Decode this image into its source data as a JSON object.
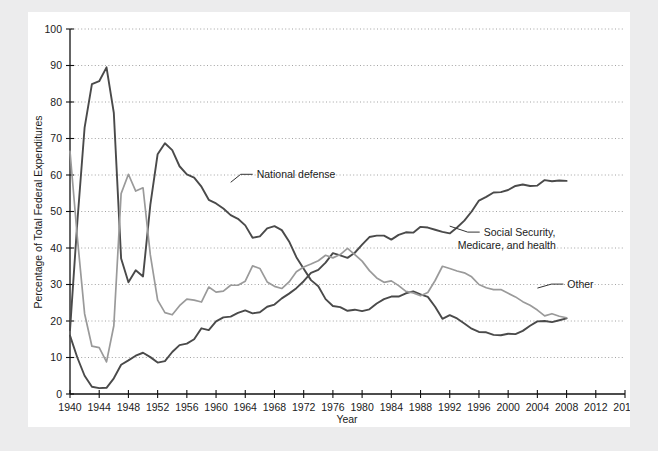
{
  "page": {
    "background_color": "#ececed",
    "panel_color": "#ffffff",
    "clipped_header_text": ""
  },
  "chart_data": {
    "type": "line",
    "title": "",
    "xlabel": "Year",
    "ylabel": "Percentage of Total Federal Expenditures",
    "xlim": [
      1940,
      2016
    ],
    "ylim": [
      0,
      100
    ],
    "xticks": [
      1940,
      1944,
      1948,
      1952,
      1956,
      1960,
      1964,
      1968,
      1972,
      1976,
      1980,
      1984,
      1988,
      1992,
      1996,
      2000,
      2004,
      2008,
      2012,
      2016
    ],
    "yticks": [
      0,
      10,
      20,
      30,
      40,
      50,
      60,
      70,
      80,
      90,
      100
    ],
    "grid": "horizontal-dotted",
    "legend_position": "inline-annotations",
    "colors": {
      "national_defense": "#4a4a4a",
      "social_security": "#4a4a4a",
      "other": "#9a9a9a",
      "axis": "#111111",
      "grid": "#8c8c8c"
    },
    "x": [
      1940,
      1941,
      1942,
      1943,
      1944,
      1945,
      1946,
      1947,
      1948,
      1949,
      1950,
      1951,
      1952,
      1953,
      1954,
      1955,
      1956,
      1957,
      1958,
      1959,
      1960,
      1961,
      1962,
      1963,
      1964,
      1965,
      1966,
      1967,
      1968,
      1969,
      1970,
      1971,
      1972,
      1973,
      1974,
      1975,
      1976,
      1977,
      1978,
      1979,
      1980,
      1981,
      1982,
      1983,
      1984,
      1985,
      1986,
      1987,
      1988,
      1989,
      1990,
      1991,
      1992,
      1993,
      1994,
      1995,
      1996,
      1997,
      1998,
      1999,
      2000,
      2001,
      2002,
      2003,
      2004,
      2005,
      2006,
      2007,
      2008
    ],
    "series": [
      {
        "name": "National defense",
        "color": "#4a4a4a",
        "label_point": {
          "year": 1962,
          "value": 58
        },
        "values": [
          17.5,
          47,
          73,
          84.9,
          85.7,
          89.5,
          77,
          37.1,
          30.6,
          33.9,
          32.2,
          51.8,
          65.7,
          68.7,
          66.8,
          62.4,
          60.2,
          59.3,
          56.8,
          53.2,
          52.2,
          50.8,
          49.0,
          48.0,
          46.2,
          42.8,
          43.2,
          45.4,
          46.0,
          44.9,
          41.8,
          37.5,
          34.3,
          31.2,
          29.5,
          26.0,
          24.1,
          23.8,
          22.8,
          23.1,
          22.7,
          23.2,
          24.8,
          26.0,
          26.7,
          26.7,
          27.6,
          28.1,
          27.3,
          26.6,
          23.9,
          20.6,
          21.6,
          20.7,
          19.3,
          17.9,
          17.0,
          16.9,
          16.2,
          16.1,
          16.5,
          16.4,
          17.3,
          18.7,
          19.9,
          20.0,
          19.7,
          20.2,
          20.7
        ]
      },
      {
        "name": "Social Security, Medicare, and health",
        "color": "#4a4a4a",
        "label_point": {
          "year": 1992,
          "value": 46
        },
        "values": [
          16.0,
          10.0,
          5.0,
          2.0,
          1.6,
          1.7,
          4.3,
          8.0,
          9.2,
          10.5,
          11.3,
          10.1,
          8.6,
          9.0,
          11.5,
          13.4,
          13.8,
          15.0,
          18.0,
          17.5,
          19.9,
          21.0,
          21.2,
          22.2,
          22.9,
          22.1,
          22.4,
          23.9,
          24.5,
          26.2,
          27.5,
          29.0,
          30.9,
          33.2,
          34.0,
          36.0,
          38.6,
          38.0,
          37.3,
          38.7,
          40.9,
          43.0,
          43.4,
          43.4,
          42.3,
          43.6,
          44.3,
          44.2,
          45.8,
          45.6,
          45.0,
          44.4,
          44.0,
          45.6,
          47.5,
          50.0,
          53.0,
          54.0,
          55.2,
          55.3,
          55.9,
          57.0,
          57.4,
          57.0,
          57.1,
          58.6,
          58.3,
          58.5,
          58.4
        ]
      },
      {
        "name": "Other",
        "color": "#9a9a9a",
        "label_point": {
          "year": 2004,
          "value": 29
        },
        "values": [
          66.5,
          43.0,
          22.0,
          13.1,
          12.7,
          8.8,
          18.7,
          54.9,
          60.2,
          55.6,
          56.5,
          38.1,
          25.7,
          22.3,
          21.7,
          24.2,
          26.0,
          25.7,
          25.2,
          29.3,
          27.9,
          28.2,
          29.8,
          29.8,
          30.9,
          35.1,
          34.4,
          30.7,
          29.5,
          28.9,
          30.7,
          33.5,
          34.8,
          35.6,
          36.5,
          38.0,
          37.3,
          38.2,
          39.9,
          38.2,
          36.4,
          33.8,
          31.8,
          30.6,
          31.0,
          29.7,
          28.1,
          27.7,
          26.9,
          27.8,
          31.1,
          35.0,
          34.4,
          33.7,
          33.2,
          32.1,
          30.0,
          29.1,
          28.6,
          28.6,
          27.6,
          26.6,
          25.3,
          24.3,
          23.0,
          21.4,
          22.0,
          21.3,
          20.9
        ]
      }
    ]
  }
}
